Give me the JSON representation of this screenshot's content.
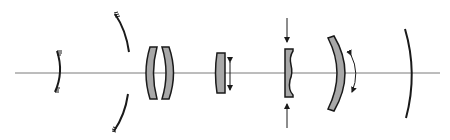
{
  "diagram": {
    "type": "optical-schematic",
    "colors": {
      "background": "#ffffff",
      "stroke": "#1a1a1a",
      "axis": "#7a7a7a",
      "glass_fill": "#a8a8a8"
    },
    "optical_axis": {
      "x1": 15,
      "x2": 440,
      "y": 73
    },
    "elements": [
      {
        "id": "secondary-mirror",
        "kind": "concave-mirror",
        "x": 57,
        "y_top": 50,
        "y_bottom": 93,
        "hatched": true
      },
      {
        "id": "primary-mirror",
        "kind": "concave-mirror-with-central-hole",
        "x": 122,
        "y_top": 13,
        "y_bottom": 130,
        "hole": [
          48,
          92
        ],
        "hatched": true
      },
      {
        "id": "meniscus-pair-left",
        "kind": "meniscus-lens",
        "x": 150,
        "y_top": 48,
        "y_bottom": 98
      },
      {
        "id": "meniscus-pair-right",
        "kind": "meniscus-lens",
        "x": 167,
        "y_top": 48,
        "y_bottom": 98
      },
      {
        "id": "focusing-lens",
        "kind": "lens",
        "x": 220,
        "y_top": 53,
        "y_bottom": 93,
        "motion": "vertical-double-arrow"
      },
      {
        "id": "compressed-lens",
        "kind": "thin-negative-lens",
        "x": 290,
        "y_top": 49,
        "y_bottom": 97,
        "motion": "inward-arrows"
      },
      {
        "id": "tilting-meniscus",
        "kind": "meniscus-lens",
        "x": 338,
        "y_top": 38,
        "y_bottom": 110,
        "motion": "curved-double-arrow"
      },
      {
        "id": "image-surface",
        "kind": "curved-focal-surface",
        "x": 410,
        "y_top": 28,
        "y_bottom": 118
      }
    ]
  }
}
